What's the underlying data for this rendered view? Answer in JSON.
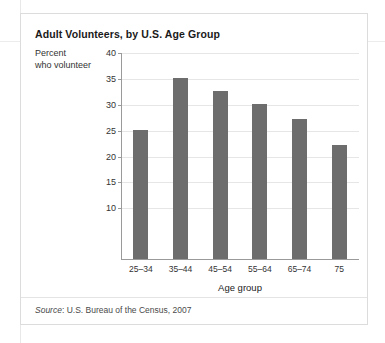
{
  "card": {
    "title": "Adult Volunteers, by U.S. Age Group",
    "source_word": "Source",
    "source_rest": ": U.S. Bureau of the Census, 2007"
  },
  "chart_data": {
    "type": "bar",
    "title": "Adult Volunteers, by U.S. Age Group",
    "subtitle": "",
    "categories": [
      "25–34",
      "35–44",
      "45–54",
      "55–64",
      "65–74",
      "75"
    ],
    "values": [
      25,
      35,
      32.5,
      30,
      27,
      22
    ],
    "xlabel": "Age group",
    "ylabel": "Percent who volunteer",
    "ylabel_line1": "Percent",
    "ylabel_line2": "who volunteer",
    "ylim": [
      0,
      40
    ],
    "yticks": [
      40,
      35,
      30,
      25,
      20,
      15,
      10
    ],
    "ytick_labels": [
      "40",
      "35",
      "30",
      "25",
      "20",
      "15",
      "10"
    ],
    "grid": true,
    "legend": "none",
    "bar_color": "#6d6d6d",
    "axis_color": "#9a9a9a",
    "grid_color": "#e6e6e6",
    "source": "Source: U.S. Bureau of the Census, 2007"
  }
}
